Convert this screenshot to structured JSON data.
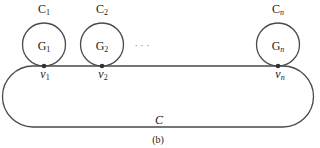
{
  "figure": {
    "caption": "(b)",
    "outer_cycle_label": "C",
    "ellipsis": "· · ·",
    "stroke_color": "#4a4a4a",
    "vertex_color": "#333333",
    "subgraphs": [
      {
        "cycle_label": "C",
        "cycle_sub": "1",
        "graph_label": "G",
        "graph_sub": "1",
        "vertex_label": "v",
        "vertex_sub": "1",
        "cx": 44
      },
      {
        "cycle_label": "C",
        "cycle_sub": "2",
        "graph_label": "G",
        "graph_sub": "2",
        "vertex_label": "v",
        "vertex_sub": "2",
        "cx": 102
      },
      {
        "cycle_label": "C",
        "cycle_sub": "n",
        "graph_label": "G",
        "graph_sub": "n",
        "vertex_label": "v",
        "vertex_sub": "n",
        "cx": 278
      }
    ]
  }
}
